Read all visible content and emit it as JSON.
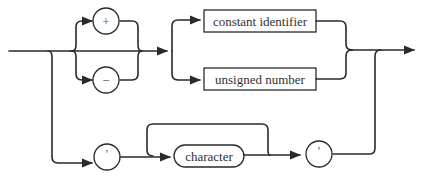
{
  "diagram": {
    "type": "syntax-diagram",
    "nodes": {
      "plus": {
        "label": "+",
        "kind": "terminal"
      },
      "minus": {
        "label": "−",
        "kind": "terminal"
      },
      "constant_identifier": {
        "label": "constant identifier",
        "kind": "nonterminal"
      },
      "unsigned_number": {
        "label": "unsigned number",
        "kind": "nonterminal"
      },
      "quote_open": {
        "label": "'",
        "kind": "terminal"
      },
      "character": {
        "label": "character",
        "kind": "terminal-class"
      },
      "quote_close": {
        "label": "'",
        "kind": "terminal"
      }
    },
    "colors": {
      "stroke": "#2a2a2a",
      "text": "#333333",
      "background": "#ffffff"
    }
  }
}
